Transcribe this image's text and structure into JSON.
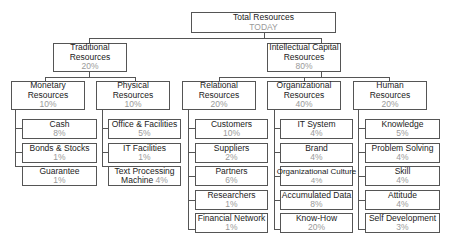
{
  "root": {
    "label": "Total Resources",
    "value": "TODAY"
  },
  "level1": [
    {
      "label": "Traditional Resources",
      "value": "20%"
    },
    {
      "label": "Intellectual Capital Resources",
      "value": "80%"
    }
  ],
  "level2": [
    {
      "label": "Monetary Resources",
      "value": "10%"
    },
    {
      "label": "Physical Resources",
      "value": "10%"
    },
    {
      "label": "Relational Resources",
      "value": "20%"
    },
    {
      "label": "Organizational Resources",
      "value": "40%"
    },
    {
      "label": "Human Resources",
      "value": "20%"
    }
  ],
  "monetary": [
    {
      "label": "Cash",
      "value": "8%"
    },
    {
      "label": "Bonds & Stocks",
      "value": "1%"
    },
    {
      "label": "Guarantee",
      "value": "1%"
    }
  ],
  "physical": [
    {
      "label": "Office & Facilities",
      "value": "5%"
    },
    {
      "label": "IT Facilities",
      "value": "1%"
    },
    {
      "label": "Text Processing",
      "label2": "Machine",
      "value": "4%"
    }
  ],
  "relational": [
    {
      "label": "Customers",
      "value": "10%"
    },
    {
      "label": "Suppliers",
      "value": "2%"
    },
    {
      "label": "Partners",
      "value": "6%"
    },
    {
      "label": "Researchers",
      "value": "1%"
    },
    {
      "label": "Financial Network",
      "value": "1%"
    }
  ],
  "organizational": [
    {
      "label": "IT System",
      "value": "4%"
    },
    {
      "label": "Brand",
      "value": "4%"
    },
    {
      "label": "Organizational Culture",
      "value": "4%"
    },
    {
      "label": "Accumulated Data",
      "value": "8%"
    },
    {
      "label": "Know-How",
      "value": "20%"
    }
  ],
  "human": [
    {
      "label": "Knowledge",
      "value": "5%"
    },
    {
      "label": "Problem Solving",
      "value": "4%"
    },
    {
      "label": "Skill",
      "value": "4%"
    },
    {
      "label": "Attitude",
      "value": "4%"
    },
    {
      "label": "Self Development",
      "value": "3%"
    }
  ]
}
